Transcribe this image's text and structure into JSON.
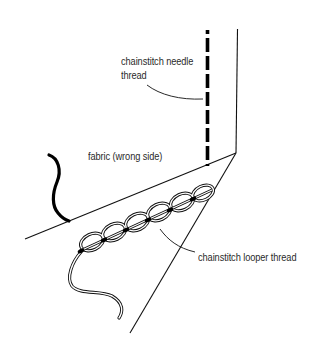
{
  "diagram": {
    "type": "sewing-stitch-illustration",
    "labels": {
      "needle_thread_line1": "chainstitch needle",
      "needle_thread_line2": "thread",
      "fabric": "fabric (wrong side)",
      "looper_thread": "chainstitch looper thread"
    },
    "colors": {
      "background": "#ffffff",
      "ink": "#111111",
      "text": "#2a2a2a"
    }
  }
}
